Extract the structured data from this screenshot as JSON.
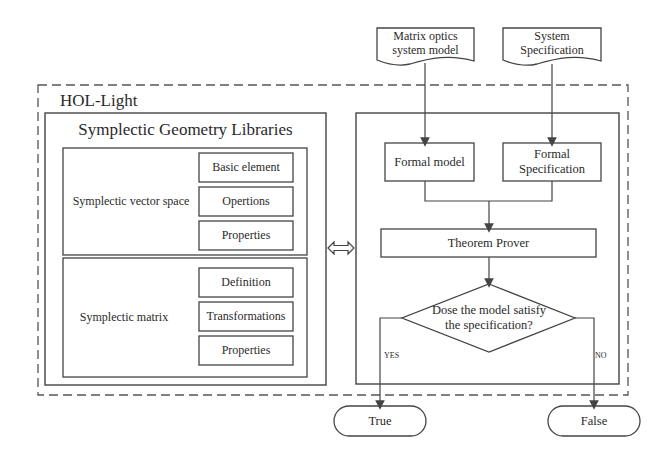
{
  "diagram": {
    "container": {
      "label": "HOL-Light"
    },
    "libraries": {
      "title": "Symplectic Geometry Libraries",
      "groups": [
        {
          "name": "Symplectic vector space",
          "items": [
            "Basic element",
            "Opertions",
            "Properties"
          ]
        },
        {
          "name": "Symplectic matrix",
          "items": [
            "Definition",
            "Transformations",
            "Properties"
          ]
        }
      ]
    },
    "inputs": {
      "model_doc": "Matrix optics system model",
      "model_doc_lines": [
        "Matrix optics",
        "system model"
      ],
      "spec_doc": "System Specification",
      "spec_doc_lines": [
        "System",
        "Specification"
      ]
    },
    "process": {
      "formal_model": "Formal model",
      "formal_spec": "Formal Specification",
      "formal_spec_lines": [
        "Formal",
        "Specification"
      ],
      "prover": "Theorem Prover",
      "decision": "Dose the model satisfy the specification?",
      "decision_lines": [
        "Dose the model satisfy",
        "the specification?"
      ],
      "yes_label": "YES",
      "no_label": "NO"
    },
    "outcomes": {
      "true_label": "True",
      "false_label": "False"
    },
    "colors": {
      "line": "#444444",
      "background": "#ffffff",
      "text": "#2a2a2a"
    }
  }
}
